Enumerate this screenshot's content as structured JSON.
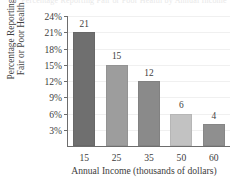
{
  "chart_data": {
    "type": "bar",
    "title": "Percentage Reporting Fair or Poor Health by Annual Income",
    "categories": [
      "15",
      "25",
      "35",
      "50",
      "60"
    ],
    "values": [
      21,
      15,
      12,
      6,
      4
    ],
    "value_labels": [
      "21",
      "15",
      "12",
      "6",
      "4"
    ],
    "xlabel": "Annual Income (thousands of dollars)",
    "ylabel_line1": "Percentage Reporting",
    "ylabel_line2": "Fair or Poor Health",
    "ytick_labels": [
      "3%",
      "6%",
      "9%",
      "12%",
      "15%",
      "18%",
      "21%",
      "24%"
    ],
    "ytick_values": [
      3,
      6,
      9,
      12,
      15,
      18,
      21,
      24
    ],
    "ylim": [
      0,
      24
    ],
    "grid": true,
    "legend": "none",
    "bar_colors": [
      "#6f6f6f",
      "#9d9d9d",
      "#8a8a8a",
      "#c2c2c2",
      "#8f8f8f"
    ],
    "axis_color": "#6d6d6d",
    "grid_color": "#f0f0f0",
    "background": "#ffffff"
  }
}
